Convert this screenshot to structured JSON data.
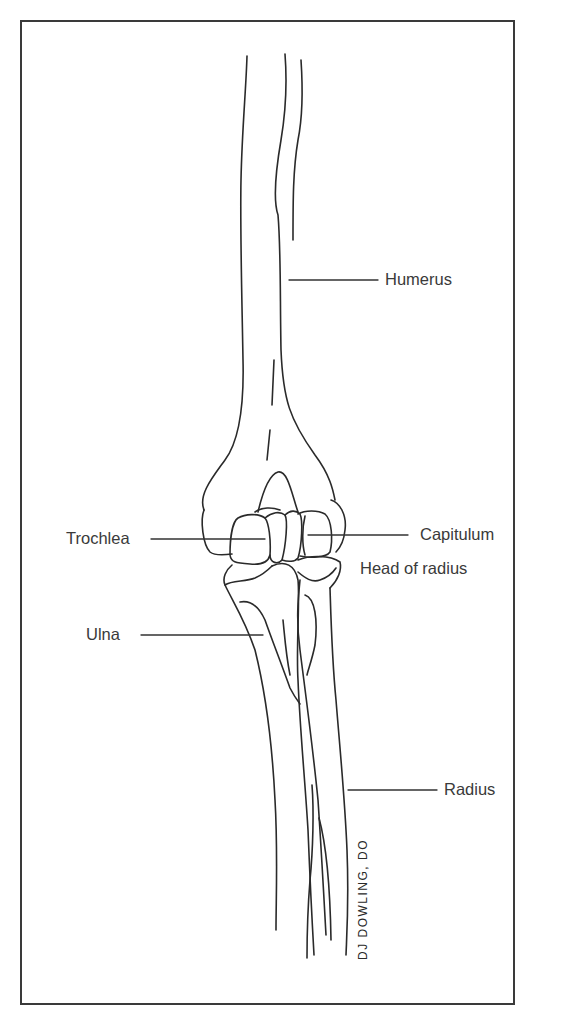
{
  "figure": {
    "labels": {
      "humerus": "Humerus",
      "trochlea": "Trochlea",
      "capitulum": "Capitulum",
      "head_of_radius": "Head of radius",
      "ulna": "Ulna",
      "radius": "Radius"
    },
    "signature": "DJ DOWLING, DO"
  },
  "colors": {
    "ink": "#2a2a2a",
    "label_text": "#3a3a3a",
    "background": "#ffffff"
  }
}
